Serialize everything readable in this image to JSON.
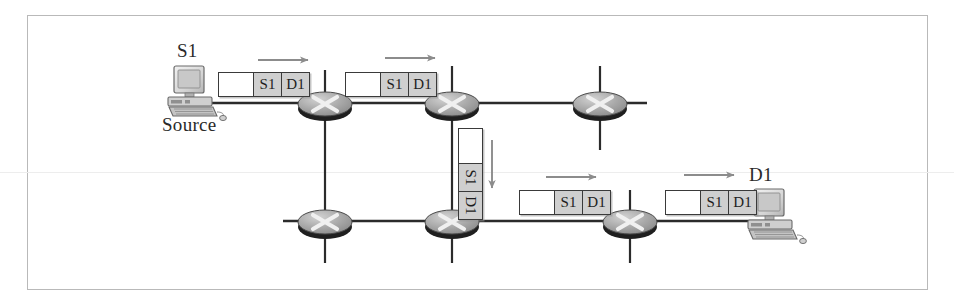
{
  "figure": {
    "type": "network-packet-switching-diagram",
    "border_color": "#b9b9b9",
    "background": "#ffffff"
  },
  "hosts": [
    {
      "id": "source-host",
      "name_label": "S1",
      "role_label": "Source",
      "x": 193,
      "y": 92
    },
    {
      "id": "destination-host",
      "name_label": "D1",
      "role_label": "",
      "x": 773,
      "y": 212
    }
  ],
  "switches": [
    {
      "id": "switch-top-1",
      "x": 325,
      "y": 103,
      "glyph": "x-cross"
    },
    {
      "id": "switch-top-2",
      "x": 452,
      "y": 103,
      "glyph": "x-cross"
    },
    {
      "id": "switch-top-3",
      "x": 600,
      "y": 103,
      "glyph": "x-cross"
    },
    {
      "id": "switch-bottom-1",
      "x": 325,
      "y": 221,
      "glyph": "x-cross"
    },
    {
      "id": "switch-bottom-2",
      "x": 452,
      "y": 221,
      "glyph": "x-cross"
    },
    {
      "id": "switch-bottom-3",
      "x": 630,
      "y": 221,
      "glyph": "x-cross"
    }
  ],
  "packets": [
    {
      "id": "packet-top-1",
      "orientation": "horizontal",
      "cells": [
        "",
        "S1",
        "D1"
      ],
      "x": 218,
      "y": 72
    },
    {
      "id": "packet-top-2",
      "orientation": "horizontal",
      "cells": [
        "",
        "S1",
        "D1"
      ],
      "x": 345,
      "y": 72
    },
    {
      "id": "packet-vertical",
      "orientation": "vertical",
      "cells": [
        "",
        "S1",
        "D1"
      ],
      "x": 458,
      "y": 128
    },
    {
      "id": "packet-bottom-1",
      "orientation": "horizontal",
      "cells": [
        "",
        "S1",
        "D1"
      ],
      "x": 519,
      "y": 190
    },
    {
      "id": "packet-bottom-2",
      "orientation": "horizontal",
      "cells": [
        "",
        "S1",
        "D1"
      ],
      "x": 665,
      "y": 190
    }
  ],
  "arrows": [
    {
      "id": "arrow-top-1",
      "direction": "right",
      "x1": 258,
      "y1": 60,
      "x2": 310,
      "y2": 60
    },
    {
      "id": "arrow-top-2",
      "direction": "right",
      "x1": 385,
      "y1": 58,
      "x2": 437,
      "y2": 58
    },
    {
      "id": "arrow-vertical",
      "direction": "down",
      "x1": 492,
      "y1": 140,
      "x2": 492,
      "y2": 190
    },
    {
      "id": "arrow-bottom-1",
      "direction": "right",
      "x1": 546,
      "y1": 177,
      "x2": 598,
      "y2": 177
    },
    {
      "id": "arrow-bottom-2",
      "direction": "right",
      "x1": 684,
      "y1": 175,
      "x2": 736,
      "y2": 175
    }
  ],
  "colors": {
    "link_line": "#2b2b2b",
    "arrow": "#8c8c8c",
    "switch_body": "#a8a8a8",
    "switch_rim": "#1f1f1f",
    "packet_fill": "#cfcfcf",
    "packet_border": "#3a3a3a",
    "text": "#2a2a2a"
  }
}
